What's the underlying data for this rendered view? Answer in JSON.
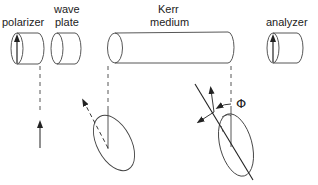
{
  "diagram": {
    "components": [
      {
        "id": "polarizer",
        "label": "polarizer"
      },
      {
        "id": "wave_plate",
        "label_line1": "wave",
        "label_line2": "plate"
      },
      {
        "id": "kerr_medium",
        "label_line1": "Kerr",
        "label_line2": "medium"
      },
      {
        "id": "analyzer",
        "label": "analyzer"
      }
    ],
    "angle_symbol": "Φ",
    "stroke_color": "#333333",
    "background": "#ffffff"
  }
}
